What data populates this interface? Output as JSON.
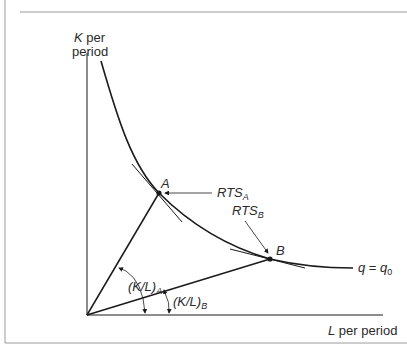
{
  "diagram": {
    "y_axis_label_line1": "K per",
    "y_axis_label_line1_var": "K",
    "y_axis_label_line1_rest": " per",
    "y_axis_label_line2": "period",
    "x_axis_label_var": "L",
    "x_axis_label_rest": " per period",
    "isoquant_label_q": "q",
    "isoquant_label_eq": " = ",
    "isoquant_label_q0": "q",
    "isoquant_label_sub": "0",
    "point_a": "A",
    "point_b": "B",
    "rts_a": "RTS",
    "rts_a_sub": "A",
    "rts_b": "RTS",
    "rts_b_sub": "B",
    "ratio_a": "(K/L)",
    "ratio_a_sub": "A",
    "ratio_b": "(K/L)",
    "ratio_b_sub": "B"
  },
  "colors": {
    "line": "#1a1a1a",
    "frame": "#9a9a9a",
    "text": "#2a2a2a"
  }
}
